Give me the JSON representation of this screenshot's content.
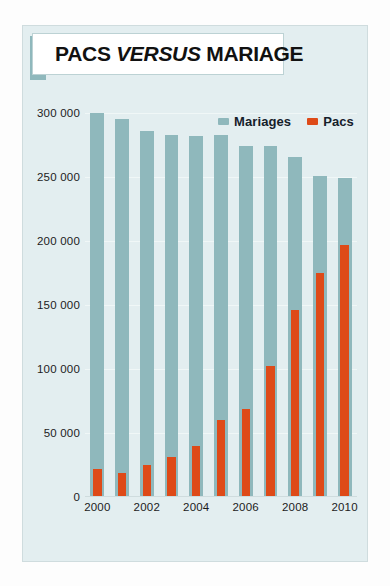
{
  "title": {
    "lead": "PACS ",
    "emphasis": "VERSUS",
    "trail": " MARIAGE",
    "full": "PACS VERSUS MARIAGE"
  },
  "legend": {
    "position": "top-right",
    "items": [
      {
        "label": "Mariages",
        "color": "#8fb8bc"
      },
      {
        "label": "Pacs",
        "color": "#de4a18"
      }
    ]
  },
  "source_note": "Sources : Insee ; ministère de la Justice.",
  "colors": {
    "mariages": "#8fb8bc",
    "pacs": "#de4a18",
    "panel_background": "#e3eef0",
    "title_accent": "#8fb8bc",
    "gridline": "#f2f8f8",
    "text": "#1c1c1c"
  },
  "axes": {
    "y_ticks": [
      "0",
      "50 000",
      "100 000",
      "150 000",
      "200 000",
      "250 000",
      "300 000"
    ],
    "y_tick_values": [
      0,
      50000,
      100000,
      150000,
      200000,
      250000,
      300000
    ],
    "x_ticks": [
      "2000",
      "2002",
      "2004",
      "2006",
      "2008",
      "2010"
    ],
    "grid": true
  },
  "chart_data": {
    "type": "bar",
    "title": "PACS VERSUS MARIAGE",
    "subtitle": "",
    "xlabel": "",
    "ylabel": "",
    "ylim": [
      0,
      300000
    ],
    "grid": true,
    "legend_position": "top-right",
    "categories": [
      "2000",
      "2001",
      "2002",
      "2003",
      "2004",
      "2005",
      "2006",
      "2007",
      "2008",
      "2009",
      "2010"
    ],
    "x_tick_labels": [
      "2000",
      "",
      "2002",
      "",
      "2004",
      "",
      "2006",
      "",
      "2008",
      "",
      "2010"
    ],
    "series": [
      {
        "name": "Mariages",
        "color": "#8fb8bc",
        "values": [
          300000,
          295000,
          286000,
          283000,
          282000,
          283000,
          274000,
          274000,
          266000,
          251000,
          249000
        ]
      },
      {
        "name": "Pacs",
        "color": "#de4a18",
        "values": [
          22000,
          19000,
          25000,
          31000,
          40000,
          60000,
          69000,
          102000,
          146000,
          175000,
          197000
        ]
      }
    ],
    "annotations": [
      "Sources : Insee ; ministère de la Justice."
    ]
  }
}
